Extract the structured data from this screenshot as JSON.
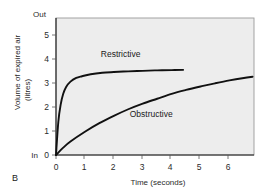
{
  "panel": {
    "label": "B"
  },
  "chart_data": {
    "type": "line",
    "title": "",
    "xlabel": "Time (seconds)",
    "ylabel": "Volume of expired air",
    "ylabel_line2": "(litres)",
    "xlim": [
      0,
      6.85
    ],
    "ylim": [
      0,
      5.6
    ],
    "xticks": [
      0,
      1,
      2,
      3,
      4,
      5,
      6
    ],
    "xticklabels": [
      "0",
      "1",
      "2",
      "3",
      "4",
      "5",
      "6"
    ],
    "yticks": [
      0,
      1,
      2,
      3,
      4,
      5
    ],
    "yticklabels": [
      "0",
      "1",
      "2",
      "3",
      "4",
      "5"
    ],
    "y_axis_top_label": "Out",
    "y_axis_bottom_label": "In",
    "grid": false,
    "legend_position": "inline-annotations",
    "series": [
      {
        "name": "Restrictive",
        "label_x": 1.55,
        "label_y": 4.0,
        "x": [
          0,
          0.08,
          0.16,
          0.25,
          0.35,
          0.5,
          0.7,
          0.9,
          1.2,
          1.6,
          2.0,
          2.5,
          3.0,
          3.5,
          4.0,
          4.4
        ],
        "y": [
          0,
          1.35,
          2.05,
          2.5,
          2.78,
          3.0,
          3.15,
          3.22,
          3.3,
          3.36,
          3.39,
          3.42,
          3.44,
          3.46,
          3.47,
          3.48
        ]
      },
      {
        "name": "Obstructive",
        "label_x": 2.55,
        "label_y": 1.55,
        "x": [
          0,
          0.25,
          0.5,
          1.0,
          1.5,
          2.0,
          2.5,
          3.0,
          3.5,
          4.0,
          4.5,
          5.0,
          5.5,
          6.0,
          6.5,
          6.8
        ],
        "y": [
          0,
          0.3,
          0.55,
          0.95,
          1.3,
          1.6,
          1.87,
          2.1,
          2.3,
          2.5,
          2.66,
          2.8,
          2.93,
          3.05,
          3.15,
          3.2
        ]
      }
    ]
  }
}
